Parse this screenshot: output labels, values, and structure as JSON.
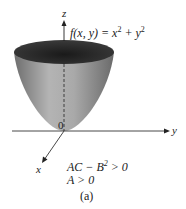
{
  "figure": {
    "function_label": "f(x, y) = x² + y²",
    "function_lhs": "f(x, y) = x",
    "function_mid": " + y",
    "exp": "2",
    "axes": {
      "z": "z",
      "y": "y",
      "x": "x",
      "origin": "0"
    },
    "conditions": {
      "line1_pre": "AC − B",
      "line1_exp": "2",
      "line1_post": " > 0",
      "line2": "A > 0"
    },
    "caption": "(a)"
  }
}
